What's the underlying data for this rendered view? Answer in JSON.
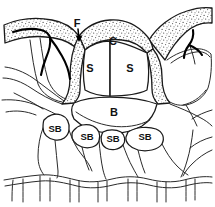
{
  "figure": {
    "background_color": "#ffffff",
    "ink_color": "#1a1a1a",
    "stipple_color": "#555555",
    "width": 215,
    "height": 207
  },
  "labels": {
    "cuticular_flange": "F",
    "cuticle": "C",
    "stomatal_guard_cell_left": "S",
    "stomatal_guard_cell_right": "S",
    "substomatal_chamber": "B",
    "subsidiary_cell_1": "SB",
    "subsidiary_cell_2": "SB",
    "subsidiary_cell_3": "SB",
    "subsidiary_cell_4": "SB"
  },
  "label_positions": {
    "cuticular_flange": {
      "x": 77,
      "y": 24
    },
    "cuticle": {
      "x": 113,
      "y": 42
    },
    "stomatal_guard_cell_left": {
      "x": 90,
      "y": 69
    },
    "stomatal_guard_cell_right": {
      "x": 130,
      "y": 69
    },
    "substomatal_chamber": {
      "x": 114,
      "y": 113
    },
    "subsidiary_cell_1": {
      "x": 55,
      "y": 129
    },
    "subsidiary_cell_2": {
      "x": 87,
      "y": 137
    },
    "subsidiary_cell_3": {
      "x": 113,
      "y": 139
    },
    "subsidiary_cell_4": {
      "x": 145,
      "y": 137
    }
  },
  "annotations": {
    "flange_arrow": "arrow pointing down to cuticular flange"
  }
}
